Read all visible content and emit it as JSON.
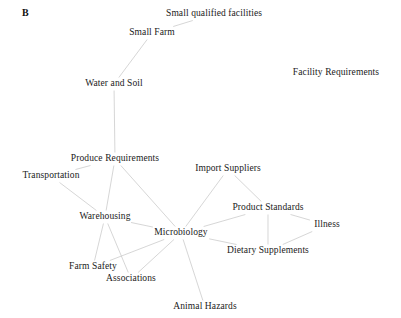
{
  "panel": {
    "label": "B"
  },
  "style": {
    "background_color": "#ffffff",
    "edge_color": "#c4c4c4",
    "label_color": "#1a1a1a"
  },
  "chart_data": {
    "type": "network",
    "title": "B",
    "xlabel": "",
    "ylabel": "",
    "grid": false,
    "legend": null,
    "xlim": [
      0,
      401
    ],
    "ylim": [
      0,
      318
    ],
    "directed": false,
    "nodes": [
      {
        "id": "small_qualified_facilities",
        "label": "Small qualified facilities",
        "x": 214,
        "y": 14
      },
      {
        "id": "small_farm",
        "label": "Small Farm",
        "x": 152,
        "y": 33
      },
      {
        "id": "water_and_soil",
        "label": "Water and Soil",
        "x": 114,
        "y": 84
      },
      {
        "id": "facility_requirements",
        "label": "Facility Requirements",
        "x": 336,
        "y": 73
      },
      {
        "id": "produce_requirements",
        "label": "Produce Requirements",
        "x": 115,
        "y": 159
      },
      {
        "id": "transportation",
        "label": "Transportation",
        "x": 51,
        "y": 176
      },
      {
        "id": "import_suppliers",
        "label": "Import Suppliers",
        "x": 228,
        "y": 169
      },
      {
        "id": "product_standards",
        "label": "Product Standards",
        "x": 268,
        "y": 208
      },
      {
        "id": "illness",
        "label": "Illness",
        "x": 327,
        "y": 225
      },
      {
        "id": "warehousing",
        "label": "Warehousing",
        "x": 105,
        "y": 217
      },
      {
        "id": "microbiology",
        "label": "Microbiology",
        "x": 181,
        "y": 233
      },
      {
        "id": "dietary_supplements",
        "label": "Dietary Supplements",
        "x": 268,
        "y": 251
      },
      {
        "id": "farm_safety",
        "label": "Farm Safety",
        "x": 93,
        "y": 267
      },
      {
        "id": "associations",
        "label": "Associations",
        "x": 131,
        "y": 279
      },
      {
        "id": "animal_hazards",
        "label": "Animal Hazards",
        "x": 205,
        "y": 307
      }
    ],
    "edges": [
      {
        "source": "small_qualified_facilities",
        "target": "small_farm"
      },
      {
        "source": "small_farm",
        "target": "water_and_soil"
      },
      {
        "source": "water_and_soil",
        "target": "produce_requirements"
      },
      {
        "source": "produce_requirements",
        "target": "transportation"
      },
      {
        "source": "produce_requirements",
        "target": "warehousing"
      },
      {
        "source": "produce_requirements",
        "target": "microbiology"
      },
      {
        "source": "transportation",
        "target": "warehousing"
      },
      {
        "source": "warehousing",
        "target": "microbiology"
      },
      {
        "source": "warehousing",
        "target": "farm_safety"
      },
      {
        "source": "warehousing",
        "target": "associations"
      },
      {
        "source": "microbiology",
        "target": "import_suppliers"
      },
      {
        "source": "microbiology",
        "target": "product_standards"
      },
      {
        "source": "microbiology",
        "target": "dietary_supplements"
      },
      {
        "source": "microbiology",
        "target": "farm_safety"
      },
      {
        "source": "microbiology",
        "target": "associations"
      },
      {
        "source": "microbiology",
        "target": "animal_hazards"
      },
      {
        "source": "import_suppliers",
        "target": "product_standards"
      },
      {
        "source": "product_standards",
        "target": "illness"
      },
      {
        "source": "product_standards",
        "target": "dietary_supplements"
      },
      {
        "source": "illness",
        "target": "dietary_supplements"
      }
    ],
    "isolated_nodes": [
      "facility_requirements"
    ]
  }
}
